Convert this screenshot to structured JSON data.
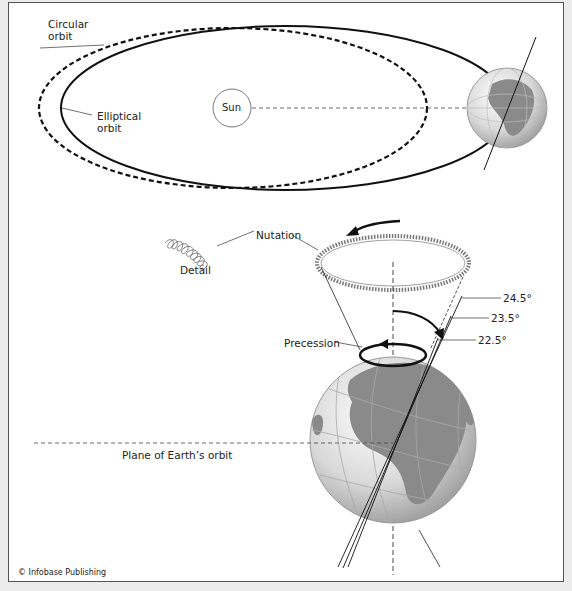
{
  "figure": {
    "labels": {
      "circular_orbit": [
        "Circular",
        "orbit"
      ],
      "elliptical_orbit": [
        "Elliptical",
        "orbit"
      ],
      "sun": "Sun",
      "nutation": "Nutation",
      "detail": "Detail",
      "precession": "Precession",
      "plane_of_orbit": "Plane of Earth’s orbit",
      "angles": [
        "24.5°",
        "23.5°",
        "22.5°"
      ],
      "credit": "© Infobase Publishing"
    },
    "colors": {
      "line": "#111111",
      "globe_land": "#8a8a8a",
      "globe_ocean": "#e8e8e8",
      "frame_border": "#555555"
    }
  }
}
